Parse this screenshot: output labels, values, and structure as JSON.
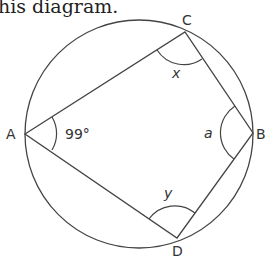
{
  "caption": "his diagram.",
  "diagram": {
    "type": "cyclic-quadrilateral-in-circle",
    "circle": {
      "cx": 139,
      "cy": 134,
      "r": 114,
      "stroke": "#444444"
    },
    "vertices": {
      "A": {
        "label": "A",
        "x": 25,
        "y": 134
      },
      "B": {
        "label": "B",
        "x": 253,
        "y": 133
      },
      "C": {
        "label": "C",
        "x": 185,
        "y": 32
      },
      "D": {
        "label": "D",
        "x": 177,
        "y": 238
      }
    },
    "angles": {
      "A": {
        "label": "99°"
      },
      "B": {
        "label": "a"
      },
      "C": {
        "label": "x"
      },
      "D": {
        "label": "y"
      }
    }
  }
}
